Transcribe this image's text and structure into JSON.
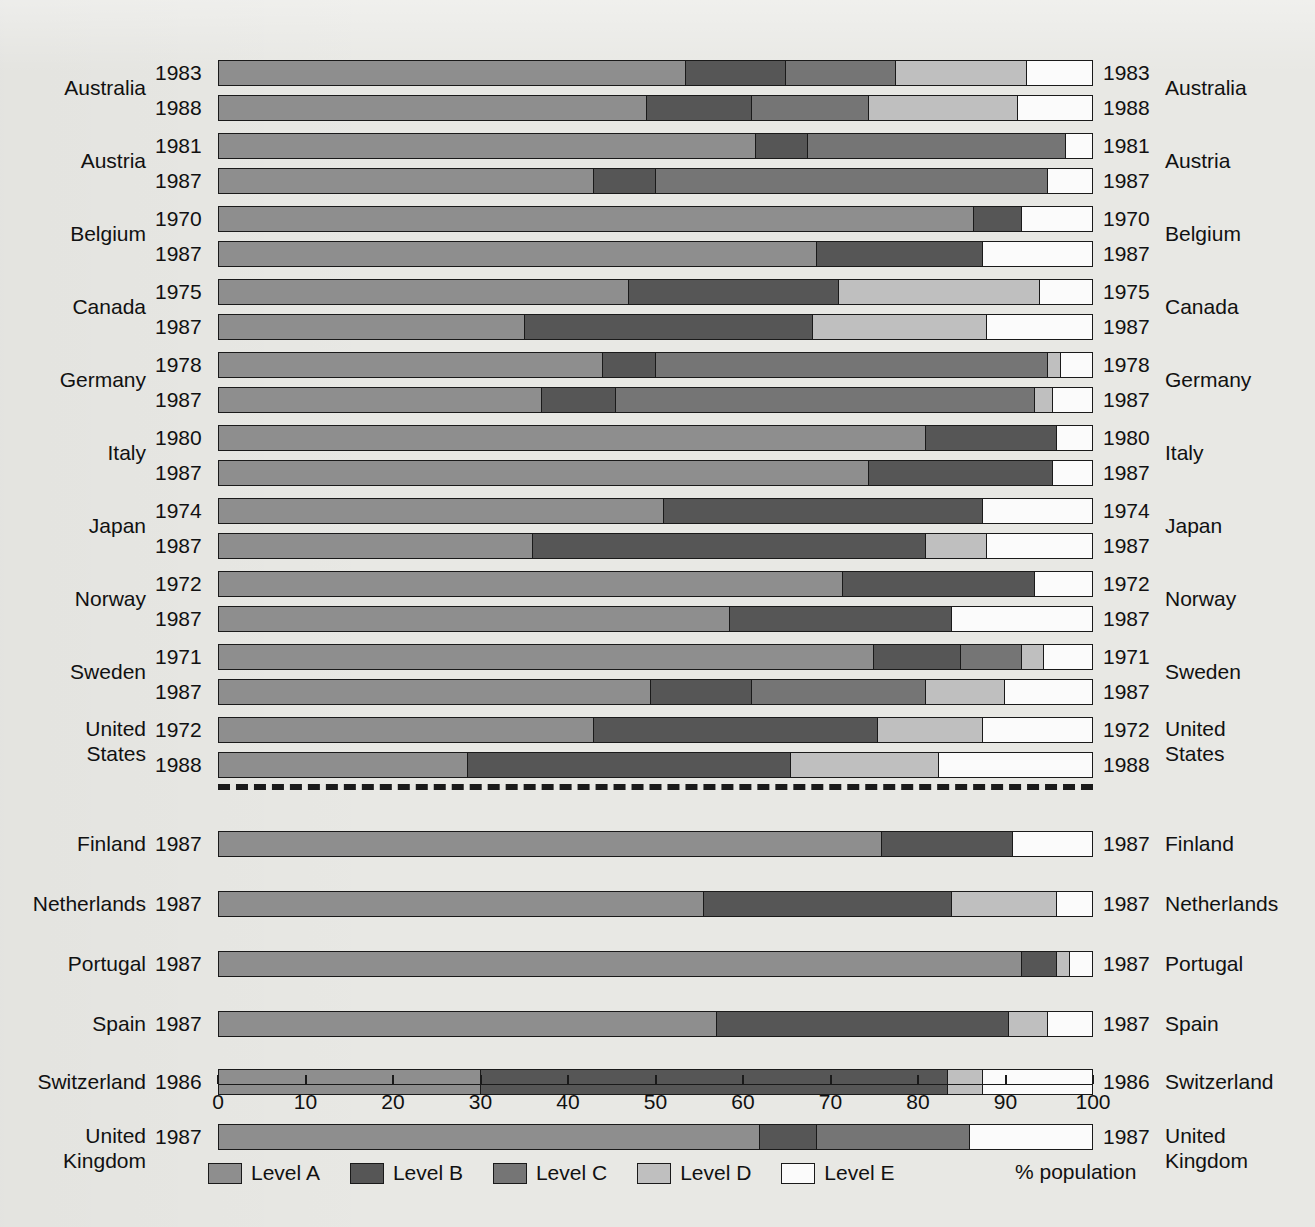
{
  "chart_data": {
    "type": "bar",
    "orientation": "horizontal",
    "stacked": true,
    "title": "",
    "xlabel": "% population",
    "ylabel": "",
    "xlim": [
      0,
      100
    ],
    "xticks": [
      0,
      10,
      20,
      30,
      40,
      50,
      60,
      70,
      80,
      90,
      100
    ],
    "grid": false,
    "legend_position": "bottom",
    "legend": [
      "Level A",
      "Level B",
      "Level C",
      "Level D",
      "Level E"
    ],
    "series": [
      {
        "name": "Level A",
        "color": "#8e8e8e"
      },
      {
        "name": "Level B",
        "color": "#565656"
      },
      {
        "name": "Level C",
        "color": "#757575"
      },
      {
        "name": "Level D",
        "color": "#bfbfbf"
      },
      {
        "name": "Level E",
        "color": "#fbfbfb"
      }
    ],
    "groups": [
      {
        "section": "top",
        "country": "Australia",
        "rows": [
          {
            "year": "1983",
            "values": [
              53.5,
              11.5,
              12.5,
              15.0,
              7.5
            ]
          },
          {
            "year": "1988",
            "values": [
              49.0,
              12.0,
              13.5,
              17.0,
              8.5
            ]
          }
        ]
      },
      {
        "section": "top",
        "country": "Austria",
        "rows": [
          {
            "year": "1981",
            "values": [
              61.5,
              6.0,
              29.5,
              0.0,
              3.0
            ]
          },
          {
            "year": "1987",
            "values": [
              43.0,
              7.0,
              45.0,
              0.0,
              5.0
            ]
          }
        ]
      },
      {
        "section": "top",
        "country": "Belgium",
        "rows": [
          {
            "year": "1970",
            "values": [
              86.5,
              5.5,
              0.0,
              0.0,
              8.0
            ]
          },
          {
            "year": "1987",
            "values": [
              68.5,
              19.0,
              0.0,
              0.0,
              12.5
            ]
          }
        ]
      },
      {
        "section": "top",
        "country": "Canada",
        "rows": [
          {
            "year": "1975",
            "values": [
              47.0,
              24.0,
              0.0,
              23.0,
              6.0
            ]
          },
          {
            "year": "1987",
            "values": [
              35.0,
              33.0,
              0.0,
              20.0,
              12.0
            ]
          }
        ]
      },
      {
        "section": "top",
        "country": "Germany",
        "rows": [
          {
            "year": "1978",
            "values": [
              44.0,
              6.0,
              45.0,
              1.5,
              3.5
            ]
          },
          {
            "year": "1987",
            "values": [
              37.0,
              8.5,
              48.0,
              2.0,
              4.5
            ]
          }
        ]
      },
      {
        "section": "top",
        "country": "Italy",
        "rows": [
          {
            "year": "1980",
            "values": [
              81.0,
              15.0,
              0.0,
              0.0,
              4.0
            ]
          },
          {
            "year": "1987",
            "values": [
              74.5,
              21.0,
              0.0,
              0.0,
              4.5
            ]
          }
        ]
      },
      {
        "section": "top",
        "country": "Japan",
        "rows": [
          {
            "year": "1974",
            "values": [
              51.0,
              36.5,
              0.0,
              0.0,
              12.5
            ]
          },
          {
            "year": "1987",
            "values": [
              36.0,
              45.0,
              0.0,
              7.0,
              12.0
            ]
          }
        ]
      },
      {
        "section": "top",
        "country": "Norway",
        "rows": [
          {
            "year": "1972",
            "values": [
              71.5,
              22.0,
              0.0,
              0.0,
              6.5
            ]
          },
          {
            "year": "1987",
            "values": [
              58.5,
              25.5,
              0.0,
              0.0,
              16.0
            ]
          }
        ]
      },
      {
        "section": "top",
        "country": "Sweden",
        "rows": [
          {
            "year": "1971",
            "values": [
              75.0,
              10.0,
              7.0,
              2.5,
              5.5
            ]
          },
          {
            "year": "1987",
            "values": [
              49.5,
              11.5,
              20.0,
              9.0,
              10.0
            ]
          }
        ]
      },
      {
        "section": "top",
        "country": "United\nStates",
        "country_line1": "United",
        "country_line2": "States",
        "rows": [
          {
            "year": "1972",
            "values": [
              43.0,
              32.5,
              0.0,
              12.0,
              12.5
            ]
          },
          {
            "year": "1988",
            "values": [
              28.5,
              37.0,
              0.0,
              17.0,
              17.5
            ]
          }
        ]
      },
      {
        "section": "bottom",
        "country": "Finland",
        "rows": [
          {
            "year": "1987",
            "values": [
              76.0,
              15.0,
              0.0,
              0.0,
              9.0
            ]
          }
        ]
      },
      {
        "section": "bottom",
        "country": "Netherlands",
        "rows": [
          {
            "year": "1987",
            "values": [
              55.5,
              28.5,
              0.0,
              12.0,
              4.0
            ]
          }
        ]
      },
      {
        "section": "bottom",
        "country": "Portugal",
        "rows": [
          {
            "year": "1987",
            "values": [
              92.0,
              4.0,
              0.0,
              1.5,
              2.5
            ]
          }
        ]
      },
      {
        "section": "bottom",
        "country": "Spain",
        "rows": [
          {
            "year": "1987",
            "values": [
              57.0,
              33.5,
              0.0,
              4.5,
              5.0
            ]
          }
        ]
      },
      {
        "section": "bottom",
        "country": "Switzerland",
        "rows": [
          {
            "year": "1986",
            "values": [
              30.0,
              53.5,
              0.0,
              4.0,
              12.5
            ]
          }
        ]
      },
      {
        "section": "bottom",
        "country": "United\nKingdom",
        "country_line1": "United",
        "country_line2": "Kingdom",
        "rows": [
          {
            "year": "1987",
            "values": [
              62.0,
              6.5,
              17.5,
              0.0,
              14.0
            ]
          }
        ]
      }
    ]
  },
  "axis": {
    "tick_labels": [
      "0",
      "10",
      "20",
      "30",
      "40",
      "50",
      "60",
      "70",
      "80",
      "90",
      "100"
    ],
    "title": "% population"
  },
  "legend": {
    "items": [
      {
        "label": "Level A",
        "color": "#8e8e8e"
      },
      {
        "label": "Level B",
        "color": "#565656"
      },
      {
        "label": "Level C",
        "color": "#757575"
      },
      {
        "label": "Level D",
        "color": "#bfbfbf"
      },
      {
        "label": "Level E",
        "color": "#fbfbfb"
      }
    ]
  },
  "background_text": {
    "top_left": "",
    "top_right": ""
  }
}
